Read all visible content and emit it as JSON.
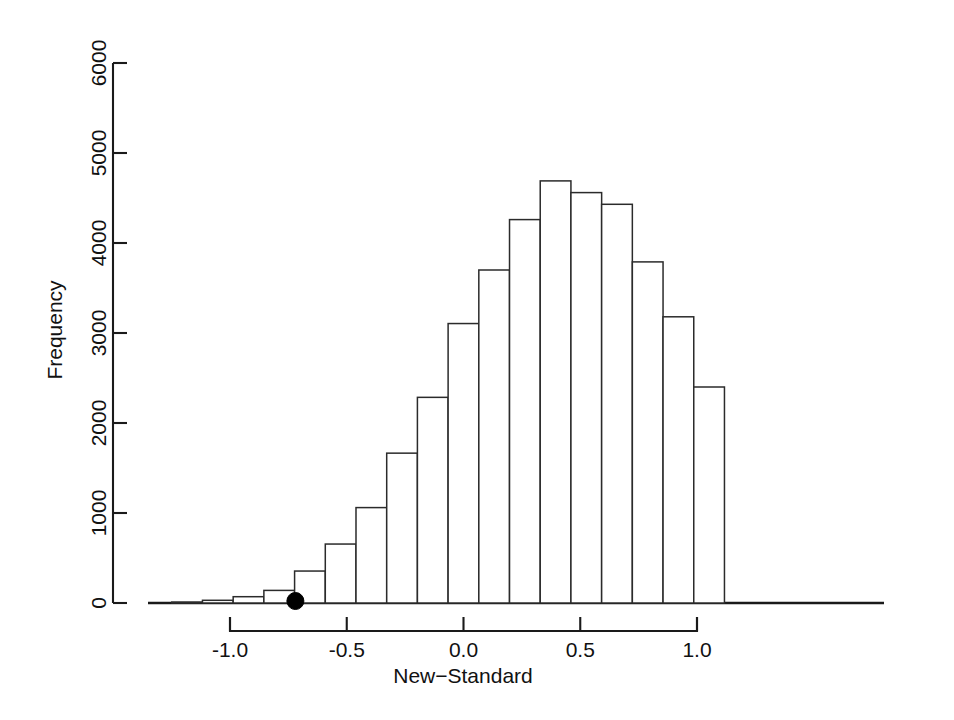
{
  "chart_data": {
    "type": "bar",
    "title": "",
    "subtitle": "",
    "xlabel": "New−Standard",
    "ylabel": "Frequency",
    "xlim": [
      -1.28,
      1.12
    ],
    "ylim": [
      0,
      6000
    ],
    "grid": false,
    "legend": null,
    "xticks": [
      "-1.0",
      "-0.5",
      "0.0",
      "0.5",
      "1.0"
    ],
    "xtick_values": [
      -1.0,
      -0.5,
      0.0,
      0.5,
      1.0
    ],
    "yticks": [
      "0",
      "1000",
      "2000",
      "3000",
      "4000",
      "5000",
      "6000"
    ],
    "ytick_values": [
      0,
      1000,
      2000,
      3000,
      4000,
      5000,
      6000
    ],
    "bin_width": 0.1315,
    "bin_edges": [
      -1.2494,
      -1.1179,
      -0.9864,
      -0.8549,
      -0.7234,
      -0.5919,
      -0.4604,
      -0.3289,
      -0.1974,
      -0.0659,
      0.0656,
      0.1971,
      0.3286,
      0.4601,
      0.5916,
      0.7231,
      0.8546,
      0.9861,
      1.1176
    ],
    "bins": [
      {
        "x0": -1.2494,
        "x1": -1.1179,
        "center": -1.1836,
        "value": 10
      },
      {
        "x0": -1.1179,
        "x1": -0.9864,
        "center": -1.0521,
        "value": 30
      },
      {
        "x0": -0.9864,
        "x1": -0.8549,
        "center": -0.9206,
        "value": 70
      },
      {
        "x0": -0.8549,
        "x1": -0.7234,
        "center": -0.7891,
        "value": 140
      },
      {
        "x0": -0.7234,
        "x1": -0.5919,
        "center": -0.6576,
        "value": 355
      },
      {
        "x0": -0.5919,
        "x1": -0.4604,
        "center": -0.5261,
        "value": 655
      },
      {
        "x0": -0.4604,
        "x1": -0.3289,
        "center": -0.3946,
        "value": 1060
      },
      {
        "x0": -0.3289,
        "x1": -0.1974,
        "center": -0.2631,
        "value": 1665
      },
      {
        "x0": -0.1974,
        "x1": -0.0659,
        "center": -0.1316,
        "value": 2285
      },
      {
        "x0": -0.0659,
        "x1": 0.0656,
        "center": -0.0001,
        "value": 3105
      },
      {
        "x0": 0.0656,
        "x1": 0.1971,
        "center": 0.1314,
        "value": 3700
      },
      {
        "x0": 0.1971,
        "x1": 0.3286,
        "center": 0.2629,
        "value": 4260
      },
      {
        "x0": 0.3286,
        "x1": 0.4601,
        "center": 0.3944,
        "value": 4690
      },
      {
        "x0": 0.4601,
        "x1": 0.5916,
        "center": 0.5259,
        "value": 4560
      },
      {
        "x0": 0.5916,
        "x1": 0.7231,
        "center": 0.6574,
        "value": 4430
      },
      {
        "x0": 0.7231,
        "x1": 0.8546,
        "center": 0.7889,
        "value": 3790
      },
      {
        "x0": 0.8546,
        "x1": 0.9861,
        "center": 0.9204,
        "value": 3180
      },
      {
        "x0": 0.9861,
        "x1": 1.1176,
        "center": 1.0519,
        "value": 2400
      }
    ],
    "categories": [
      "-1.18",
      "-1.05",
      "-0.92",
      "-0.79",
      "-0.66",
      "-0.53",
      "-0.39",
      "-0.26",
      "-0.13",
      "0.00",
      "0.13",
      "0.26",
      "0.39",
      "0.53",
      "0.66",
      "0.79",
      "0.92",
      "1.05"
    ],
    "values": [
      10,
      30,
      70,
      140,
      355,
      655,
      1060,
      1665,
      2285,
      3105,
      3700,
      4260,
      4690,
      4560,
      4430,
      3790,
      3180,
      2400
    ],
    "annotations": [
      {
        "name": "observed-statistic-marker",
        "type": "point",
        "x": -0.72,
        "y": 0,
        "label": ""
      }
    ]
  },
  "axes": {
    "x_title": "New−Standard",
    "y_title": "Frequency"
  },
  "colors": {
    "background": "#ffffff",
    "foreground": "#000000",
    "bar_fill": "#ffffff",
    "bar_stroke": "#2b2b2b",
    "axis": "#1a1a1a",
    "marker": "#000000"
  }
}
